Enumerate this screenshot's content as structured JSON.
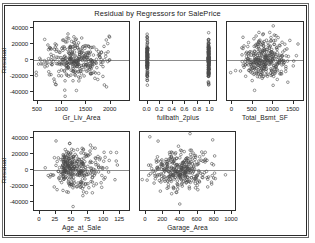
{
  "chart_data": {
    "type": "scatter",
    "title": "Residual by Regressors for SalePrice",
    "ylabel": "Residual",
    "ylim": [
      -52000,
      48000
    ],
    "yticks": [
      40000,
      20000,
      0,
      -20000,
      -40000
    ],
    "ytick_labels": [
      "40000",
      "20000",
      "0",
      "-20000",
      "-40000"
    ],
    "grid": false,
    "legend": "none",
    "reference_line_y": 0,
    "marker": "open-circle",
    "marker_color": "#4a4a4a",
    "reference_line_color": "#8c8c8c",
    "panels": [
      {
        "id": "gr-liv-area",
        "xlabel": "Gr_Liv_Area",
        "xlim": [
          420,
          2420
        ],
        "xticks": [
          500,
          1000,
          1500,
          2000
        ],
        "xtick_labels": [
          "500",
          "1000",
          "1500",
          "2000"
        ],
        "n_points": 330,
        "seed": 11,
        "dist": "cloud",
        "x_center": 0.44,
        "x_spread": 0.17,
        "y_spread": 0.135
      },
      {
        "id": "fullbath-2plus",
        "xlabel": "fullbath_2plus",
        "xlim": [
          -0.12,
          1.12
        ],
        "xticks": [
          0.0,
          0.2,
          0.4,
          0.6,
          0.8,
          1.0
        ],
        "xtick_labels": [
          "0.0",
          "0.2",
          "0.4",
          "0.6",
          "0.8",
          "1.0"
        ],
        "n_points": 300,
        "seed": 23,
        "dist": "binary",
        "x_center": 0.5,
        "x_spread": 0.0,
        "y_spread": 0.125
      },
      {
        "id": "total-bsmt-sf",
        "xlabel": "Total_Bsmt_SF",
        "xlim": [
          -130,
          1780
        ],
        "xticks": [
          0,
          500,
          1000,
          1500
        ],
        "xtick_labels": [
          "0",
          "500",
          "1000",
          "1500"
        ],
        "n_points": 330,
        "seed": 37,
        "dist": "cloud",
        "x_center": 0.52,
        "x_spread": 0.155,
        "y_spread": 0.13
      },
      {
        "id": "age-at-sale",
        "xlabel": "Age_at_Sale",
        "xlim": [
          -9,
          142
        ],
        "xticks": [
          0,
          25,
          50,
          75,
          100,
          125
        ],
        "xtick_labels": [
          "0",
          "25",
          "50",
          "75",
          "100",
          "125"
        ],
        "n_points": 330,
        "seed": 53,
        "dist": "skew",
        "x_center": 0.3,
        "x_spread": 0.2,
        "y_spread": 0.13
      },
      {
        "id": "garage-area",
        "xlabel": "Garage_Area",
        "xlim": [
          -70,
          1060
        ],
        "xticks": [
          0,
          200,
          400,
          600,
          800,
          1000
        ],
        "xtick_labels": [
          "0",
          "200",
          "400",
          "600",
          "800",
          "1000"
        ],
        "n_points": 330,
        "seed": 71,
        "dist": "cloud",
        "x_center": 0.42,
        "x_spread": 0.145,
        "y_spread": 0.13
      }
    ]
  },
  "layout": {
    "panels_px": [
      {
        "left": 33,
        "top": 21,
        "width": 97,
        "height": 80
      },
      {
        "left": 139,
        "top": 21,
        "width": 78,
        "height": 80
      },
      {
        "left": 226,
        "top": 21,
        "width": 78,
        "height": 80
      },
      {
        "left": 33,
        "top": 131,
        "width": 97,
        "height": 80
      },
      {
        "left": 139,
        "top": 131,
        "width": 97,
        "height": 80
      }
    ],
    "yaxis_panels": [
      0,
      3
    ]
  }
}
